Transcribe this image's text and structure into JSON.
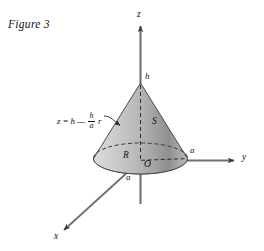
{
  "figure": {
    "caption": "Figure 3"
  },
  "axes": {
    "z_label": "z",
    "y_label": "y",
    "x_label": "x",
    "origin_label": "O"
  },
  "labels": {
    "apex_height": "h",
    "surface": "S",
    "base_disk": "R",
    "radius_y": "a",
    "radius_x": "a"
  },
  "equation": {
    "lhs": "z",
    "equals": "=",
    "h_term": "h",
    "minus": "—",
    "frac_num": "h",
    "frac_den": "a",
    "r_term": "r",
    "plain": "z = h − (h/a) r"
  },
  "colors": {
    "background": "#ffffff",
    "ink": "#111111",
    "axis": "#6f6f6f",
    "cone_light": "#e8e8e8",
    "cone_mid": "#b9b9b9",
    "cone_dark": "#8a8a8a",
    "base_fill": "#b5b5b5",
    "outline": "#4a4a4a"
  }
}
